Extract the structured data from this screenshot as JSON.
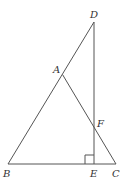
{
  "diagram": {
    "type": "geometry",
    "points": {
      "D": {
        "label": "D",
        "x": 94,
        "y": 22,
        "lx": 90,
        "ly": 18
      },
      "A": {
        "label": "A",
        "x": 62.5,
        "y": 74.5,
        "lx": 53,
        "ly": 73
      },
      "F": {
        "label": "F",
        "x": 94,
        "y": 126,
        "lx": 97,
        "ly": 127
      },
      "B": {
        "label": "B",
        "x": 8,
        "y": 164,
        "lx": 3,
        "ly": 177
      },
      "E": {
        "label": "E",
        "x": 94,
        "y": 164,
        "lx": 90,
        "ly": 177
      },
      "C": {
        "label": "C",
        "x": 116,
        "y": 164,
        "lx": 112,
        "ly": 177
      }
    },
    "segments": [
      [
        "B",
        "D"
      ],
      [
        "A",
        "C"
      ],
      [
        "B",
        "C"
      ],
      [
        "D",
        "E"
      ]
    ],
    "right_angle": {
      "at": "E",
      "size": 9
    },
    "colors": {
      "stroke": "#555555",
      "label": "#333333"
    }
  }
}
